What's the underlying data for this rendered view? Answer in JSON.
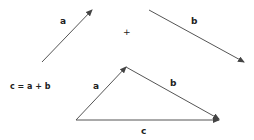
{
  "diagram": {
    "vectors": {
      "a": {
        "label": "a",
        "from": [
          42,
          62
        ],
        "to": [
          92,
          10
        ]
      },
      "b": {
        "label": "b",
        "from": [
          149,
          10
        ],
        "to": [
          244,
          62
        ]
      }
    },
    "plus_sign": "+",
    "equation": "c = a + b",
    "triangle": {
      "a": {
        "label": "a",
        "from": [
          76,
          120
        ],
        "to": [
          126,
          67
        ]
      },
      "b": {
        "label": "b",
        "from": [
          126,
          67
        ],
        "to": [
          219,
          119
        ]
      },
      "c": {
        "label": "c",
        "from": [
          76,
          120
        ],
        "to": [
          219,
          120
        ]
      }
    },
    "stroke_color": "#555555"
  }
}
